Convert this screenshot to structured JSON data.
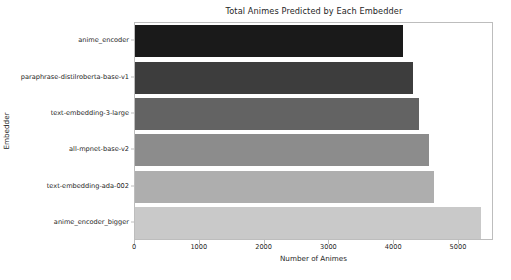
{
  "chart_data": {
    "type": "bar",
    "orientation": "horizontal",
    "title": "Total Animes Predicted by Each Embedder",
    "xlabel": "Number of Animes",
    "ylabel": "Embedder",
    "categories": [
      "anime_encoder",
      "paraphrase-distilroberta-base-v1",
      "text-embedding-3-large",
      "all-mpnet-base-v2",
      "text-embedding-ada-002",
      "anime_encoder_bigger"
    ],
    "values": [
      4140,
      4290,
      4380,
      4540,
      4615,
      5340
    ],
    "colors": [
      "#1a1a1a",
      "#3d3d3d",
      "#636363",
      "#8c8c8c",
      "#aeaeae",
      "#c9c9c9"
    ],
    "xlim": [
      0,
      5540
    ],
    "xticks": [
      0,
      1000,
      2000,
      3000,
      4000,
      5000
    ],
    "xtick_labels": [
      "0",
      "1000",
      "2000",
      "3000",
      "4000",
      "5000"
    ],
    "grid": false,
    "legend": false
  }
}
